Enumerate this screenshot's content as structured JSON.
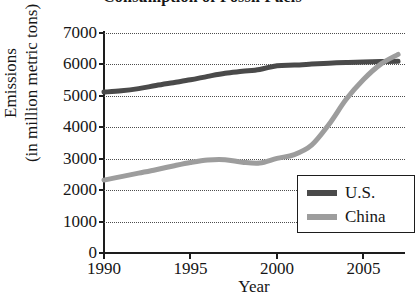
{
  "chart_data": {
    "type": "line",
    "title": "Consumption of Fossil Fuels",
    "xlabel": "Year",
    "ylabel_line1": "Emissions",
    "ylabel_line2": "(in million metric tons)",
    "xlim": [
      1990,
      2007.4
    ],
    "ylim": [
      0,
      7000
    ],
    "grid": true,
    "legend_position": "bottom-right",
    "xticks": [
      1990,
      1995,
      2000,
      2005
    ],
    "xtick_labels": [
      "1990",
      "1995",
      "2000",
      "2005"
    ],
    "yticks": [
      0,
      1000,
      2000,
      3000,
      4000,
      5000,
      6000,
      7000
    ],
    "ytick_labels": [
      "0",
      "1000",
      "2000",
      "3000",
      "4000",
      "5000",
      "6000",
      "7000"
    ],
    "x": [
      1990,
      1991,
      1992,
      1993,
      1994,
      1995,
      1996,
      1997,
      1998,
      1999,
      2000,
      2001,
      2002,
      2003,
      2004,
      2005,
      2006,
      2007
    ],
    "series": [
      {
        "name": "U.S.",
        "color": "#4a4a4a",
        "values": [
          5120,
          5160,
          5230,
          5330,
          5420,
          5510,
          5620,
          5720,
          5780,
          5840,
          5960,
          5980,
          6010,
          6040,
          6060,
          6080,
          6090,
          6100
        ]
      },
      {
        "name": "China",
        "color": "#9d9d9d",
        "values": [
          2320,
          2430,
          2540,
          2650,
          2770,
          2880,
          2960,
          2970,
          2890,
          2860,
          3010,
          3130,
          3430,
          4090,
          4890,
          5520,
          6010,
          6320
        ]
      }
    ]
  },
  "legend": {
    "entries": [
      {
        "label": "U.S.",
        "swatch": "#4a4a4a"
      },
      {
        "label": "China",
        "swatch": "#9d9d9d"
      }
    ]
  }
}
